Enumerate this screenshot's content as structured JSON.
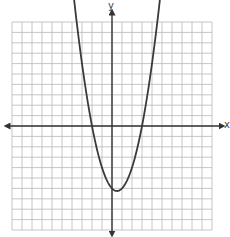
{
  "chart_data": {
    "type": "line",
    "title": "",
    "xlabel": "x",
    "ylabel": "y",
    "xlim": [
      -10,
      10
    ],
    "ylim": [
      -10,
      10
    ],
    "grid": true,
    "grid_step": 1,
    "function": "y = x^2 - x - 6",
    "x_intercepts": [
      -2,
      3
    ],
    "y_intercept": -6,
    "vertex": [
      0.5,
      -6.25
    ],
    "series": [
      {
        "name": "parabola",
        "x": [
          -3.5,
          -3,
          -2,
          -1,
          0,
          0.5,
          1,
          2,
          3,
          4,
          4.5
        ],
        "y": [
          9.75,
          6,
          0,
          -4,
          -6,
          -6.25,
          -6,
          -4,
          0,
          6,
          9.75
        ]
      }
    ]
  },
  "axes": {
    "x_label": "x",
    "y_label": "y"
  },
  "colors": {
    "grid": "#b8b8b8",
    "axis": "#333333",
    "curve": "#3a3a3a"
  }
}
